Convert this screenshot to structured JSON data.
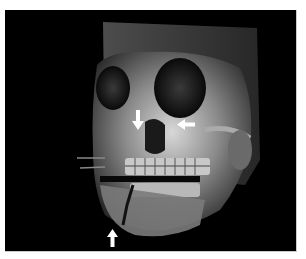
{
  "figure": {
    "background_color": "#000000",
    "arrows": [
      {
        "id": "nasal-arrow",
        "direction": "down",
        "color": "#ffffff"
      },
      {
        "id": "orbital-arrow",
        "direction": "left",
        "color": "#ffffff"
      },
      {
        "id": "mandible-arrow",
        "direction": "up",
        "color": "#ffffff"
      }
    ]
  }
}
